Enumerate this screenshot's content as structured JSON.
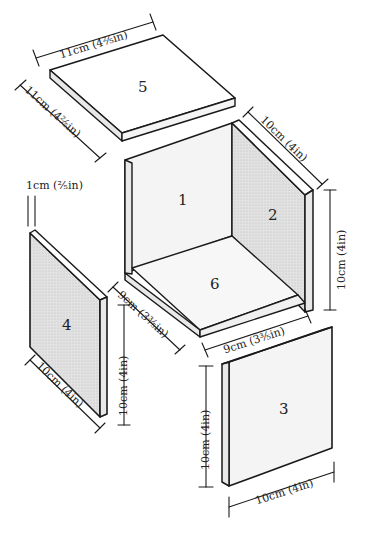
{
  "diagram": {
    "panels": [
      {
        "id": "1",
        "label": "1",
        "role": "back wall"
      },
      {
        "id": "2",
        "label": "2",
        "role": "right side wall"
      },
      {
        "id": "3",
        "label": "3",
        "role": "front panel"
      },
      {
        "id": "4",
        "label": "4",
        "role": "left side panel"
      },
      {
        "id": "5",
        "label": "5",
        "role": "lid"
      },
      {
        "id": "6",
        "label": "6",
        "role": "base"
      }
    ],
    "dimensions": {
      "lid_width": "11cm (4²⁄₅in)",
      "lid_depth": "11cm (4²⁄₅in)",
      "thickness": "1cm (²⁄₅in)",
      "side_depth": "10cm (4in)",
      "side_height": "10cm (4in)",
      "base_depth": "9cm (3³⁄₅in)",
      "base_width": "9cm (3³⁄₅in)",
      "panel4_height": "10cm (4in)",
      "panel4_width": "10cm (4in)",
      "panel3_height": "10cm (4in)",
      "panel3_width": "10cm (4in)"
    },
    "colors": {
      "line": "#1a1a1a",
      "shaded_face": "#dcdcdc",
      "light_face": "#f4f4f4",
      "edge_face": "#e8e8e8"
    }
  }
}
